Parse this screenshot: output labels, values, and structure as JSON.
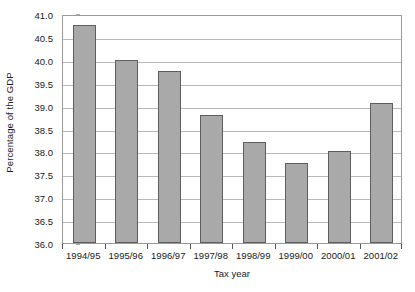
{
  "chart_data": {
    "type": "bar",
    "title": "",
    "subtitle": "",
    "xlabel": "Tax year",
    "ylabel": "Percentage of the GDP",
    "categories": [
      "1994/95",
      "1995/96",
      "1996/97",
      "1997/98",
      "1998/99",
      "1999/00",
      "2000/01",
      "2001/02"
    ],
    "values": [
      40.75,
      40.0,
      39.75,
      38.8,
      38.2,
      37.75,
      38.0,
      39.05
    ],
    "ylim": [
      36.0,
      41.0
    ],
    "ytick_labels": [
      "41.0",
      "40.5",
      "40.0",
      "39.5",
      "39.0",
      "38.5",
      "38.0",
      "37.5",
      "37.0",
      "36.5",
      "36.0"
    ],
    "ytick_values": [
      41.0,
      40.5,
      40.0,
      39.5,
      39.0,
      38.5,
      38.0,
      37.5,
      37.0,
      36.5,
      36.0
    ],
    "ytick_step": 0.5,
    "grid": true,
    "grid_axis": "y",
    "legend": false,
    "legend_position": "none",
    "series_color": "#a9a9a9",
    "series_border_color": "#5e5e5e",
    "gridline_color": "#b9b9b9",
    "axis_color": "#9a9a9a",
    "background_color": "#ffffff",
    "annotations": []
  }
}
